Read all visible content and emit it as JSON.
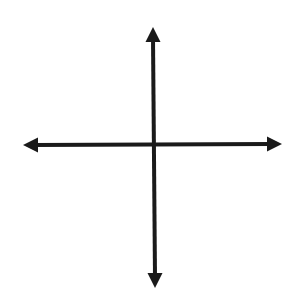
{
  "diagram": {
    "type": "coordinate-axes",
    "colors": {
      "background": "#ffffff",
      "stroke": "#1a1a1a"
    },
    "stroke_width": 4,
    "horizontal_axis": {
      "start": [
        23,
        145
      ],
      "end": [
        282,
        144
      ],
      "arrowheads": [
        "left",
        "right"
      ]
    },
    "vertical_axis": {
      "start": [
        153,
        27
      ],
      "end": [
        155,
        288
      ],
      "arrowheads": [
        "up",
        "down"
      ]
    },
    "origin": [
      154,
      145
    ]
  }
}
